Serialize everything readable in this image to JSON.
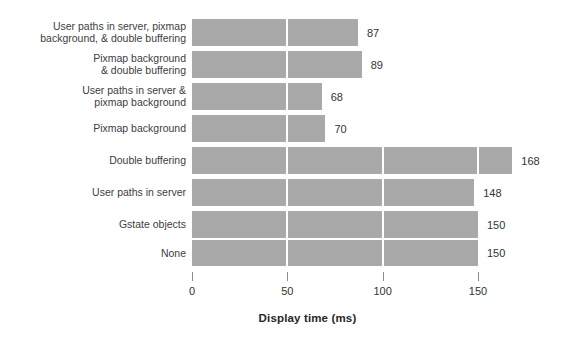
{
  "chart_data": {
    "type": "bar",
    "orientation": "horizontal",
    "title": "",
    "xlabel": "Display time (ms)",
    "ylabel": "",
    "xlim": [
      0,
      175
    ],
    "xticks": [
      0,
      50,
      100,
      150
    ],
    "xtick_labels": [
      "0",
      "50",
      "100",
      "150"
    ],
    "grid": false,
    "legend": null,
    "bar_color": "#a9a9a9",
    "separator_color": "#ffffff",
    "separators_at": [
      50,
      100,
      150
    ],
    "categories": [
      "User paths in server, pixmap\nbackground, & double buffering",
      "Pixmap background\n& double buffering",
      "User paths in server &\npixmap background",
      "Pixmap background",
      "Double buffering",
      "User paths in server",
      "Gstate objects",
      "None"
    ],
    "values": [
      87,
      89,
      68,
      70,
      168,
      148,
      150,
      150
    ],
    "value_labels": [
      "87",
      "89",
      "68",
      "70",
      "168",
      "148",
      "150",
      "150"
    ]
  },
  "axis": {
    "title": "Display time (ms)",
    "ticks": [
      {
        "value": 0,
        "label": "0"
      },
      {
        "value": 50,
        "label": "50"
      },
      {
        "value": 100,
        "label": "100"
      },
      {
        "value": 150,
        "label": "150"
      }
    ]
  },
  "rows": [
    {
      "label": "User paths in server, pixmap\nbackground, & double buffering",
      "value": 87,
      "value_label": "87"
    },
    {
      "label": "Pixmap background\n& double buffering",
      "value": 89,
      "value_label": "89"
    },
    {
      "label": "User paths in server &\npixmap background",
      "value": 68,
      "value_label": "68"
    },
    {
      "label": "Pixmap background",
      "value": 70,
      "value_label": "70"
    },
    {
      "label": "Double buffering",
      "value": 168,
      "value_label": "168"
    },
    {
      "label": "User paths in server",
      "value": 148,
      "value_label": "148"
    },
    {
      "label": "Gstate objects",
      "value": 150,
      "value_label": "150"
    },
    {
      "label": "None",
      "value": 150,
      "value_label": "150"
    }
  ]
}
